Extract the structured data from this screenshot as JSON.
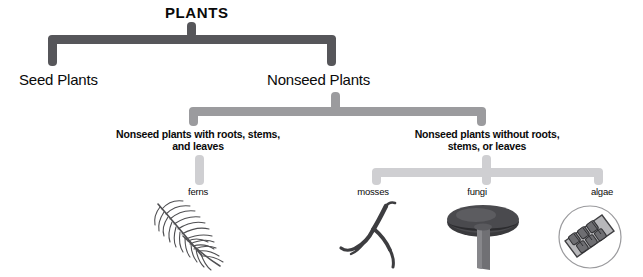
{
  "diagram": {
    "title": "PLANTS",
    "level1": {
      "seed": "Seed Plants",
      "nonseed": "Nonseed Plants"
    },
    "level2": {
      "with_parts": "Nonseed plants with roots, stems, and leaves",
      "without_parts": "Nonseed plants without roots, stems, or leaves"
    },
    "level3": {
      "ferns": "ferns",
      "mosses": "mosses",
      "fungi": "fungi",
      "algae": "algae"
    },
    "illustrations": {
      "fern": "fern-frond-illustration",
      "moss": "moss-strand-illustration",
      "fungus": "mushroom-illustration",
      "alga": "algae-cells-microscope-illustration"
    },
    "colors": {
      "level1_bracket": "#56565a",
      "level2_bracket": "#9b9b9e",
      "level3_bracket": "#cfcfd2",
      "text": "#0a0a0a",
      "background": "#ffffff"
    }
  }
}
